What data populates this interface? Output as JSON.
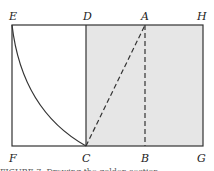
{
  "labels": {
    "E": "E",
    "D": "D",
    "A": "A",
    "H": "H",
    "F": "F",
    "C": "C",
    "B": "B",
    "G": "G"
  },
  "colors": {
    "shade": "#e6e6e6",
    "line": "#333333"
  },
  "caption": "FIGURE 7. Drawing the golden section"
}
